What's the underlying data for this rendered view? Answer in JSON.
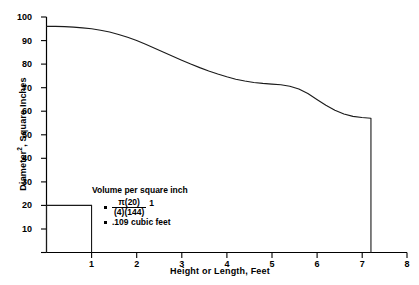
{
  "chart_data": {
    "type": "line",
    "title": "",
    "xlabel": "Height or Length, Feet",
    "ylabel": "Diameter2, Square Inches",
    "ylabel_base": "Diameter",
    "ylabel_exponent": "2",
    "ylabel_rest": ", Square Inches",
    "xlim": [
      0,
      8
    ],
    "ylim": [
      0,
      100
    ],
    "grid": false,
    "legend": "none",
    "xticks": [
      0,
      1,
      2,
      3,
      4,
      5,
      6,
      7,
      8
    ],
    "xtick_labels": [
      "",
      "1",
      "2",
      "3",
      "4",
      "5",
      "6",
      "7",
      "8"
    ],
    "yticks": [
      10,
      20,
      30,
      40,
      50,
      60,
      70,
      80,
      90,
      100
    ],
    "ytick_labels": [
      "10",
      "20",
      "30",
      "40",
      "50",
      "60",
      "70",
      "80",
      "90",
      "100"
    ],
    "series": [
      {
        "name": "diameter-squared-curve",
        "x": [
          0.0,
          0.2,
          0.4,
          0.6,
          0.8,
          1.0,
          1.2,
          1.4,
          1.6,
          1.8,
          2.0,
          2.2,
          2.4,
          2.6,
          2.8,
          3.0,
          3.2,
          3.4,
          3.6,
          3.8,
          4.0,
          4.2,
          4.4,
          4.6,
          4.8,
          5.0,
          5.2,
          5.4,
          5.6,
          5.8,
          6.0,
          6.2,
          6.4,
          6.6,
          6.8,
          7.0,
          7.2,
          7.2
        ],
        "y": [
          96.0,
          96.0,
          95.9,
          95.7,
          95.4,
          95.0,
          94.4,
          93.6,
          92.6,
          91.4,
          90.0,
          88.4,
          86.7,
          85.0,
          83.3,
          81.6,
          80.0,
          78.5,
          77.1,
          75.8,
          74.6,
          73.6,
          72.8,
          72.2,
          71.8,
          71.5,
          71.2,
          70.6,
          69.4,
          67.5,
          65.0,
          62.5,
          60.4,
          58.8,
          57.8,
          57.3,
          57.0,
          0.0
        ]
      },
      {
        "name": "volume-reference-rectangle",
        "x": [
          0.0,
          0.0,
          1.0,
          1.0
        ],
        "y": [
          0.0,
          20.0,
          20.0,
          0.0
        ]
      }
    ],
    "annotations": {
      "heading": "Volume per square inch",
      "formula_numerator": "π(20)",
      "formula_denominator": "(4)(144)",
      "formula_tail": "1",
      "result": ".109 cubic feet"
    }
  }
}
